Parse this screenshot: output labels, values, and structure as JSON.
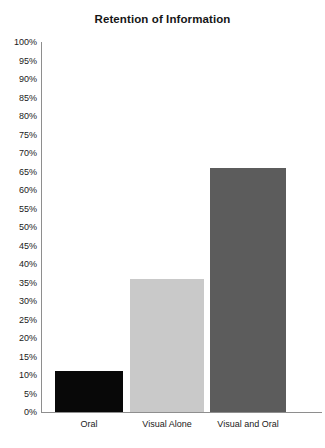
{
  "chart_data": {
    "type": "bar",
    "title": "Retention of Information",
    "xlabel": "",
    "ylabel": "",
    "categories": [
      "Oral",
      "Visual Alone",
      "Visual and Oral"
    ],
    "values": [
      11,
      36,
      66
    ],
    "value_labels": [
      "11%",
      "36%",
      "66%"
    ],
    "ylim": [
      0,
      100
    ],
    "y_tick_step": 5,
    "y_ticks": [
      "0%",
      "5%",
      "10%",
      "15%",
      "20%",
      "25%",
      "30%",
      "35%",
      "40%",
      "45%",
      "50%",
      "55%",
      "60%",
      "65%",
      "70%",
      "75%",
      "80%",
      "85%",
      "90%",
      "95%",
      "100%"
    ],
    "grid": false,
    "legend": "none",
    "series": [
      {
        "name": "Retention",
        "values": [
          11,
          36,
          66
        ],
        "colors": [
          "#080808",
          "#c9c9c9",
          "#5c5c5c"
        ]
      }
    ],
    "bar_colors": {
      "oral": "#080808",
      "visual_alone": "#c9c9c9",
      "visual_and_oral": "#5c5c5c"
    },
    "axis_color": "#8e8e8e",
    "background": "#ffffff",
    "text_color": "#1a1a1a"
  }
}
